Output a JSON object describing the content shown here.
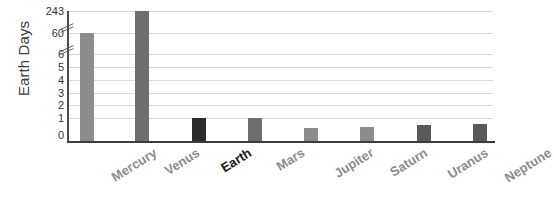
{
  "chart_data": {
    "type": "bar",
    "title": "",
    "xlabel": "",
    "ylabel": "Earth Days",
    "categories": [
      "Mercury",
      "Venus",
      "Earth",
      "Mars",
      "Jupiter",
      "Saturn",
      "Uranus",
      "Neptune"
    ],
    "values": [
      59,
      243,
      1,
      1.7,
      0.4,
      0.45,
      0.7,
      0.9
    ],
    "value_labels": [
      "59",
      "243",
      "1",
      "1.7",
      "0.4",
      "0.45",
      "0.7",
      "0.9"
    ],
    "ylim": [
      0,
      243
    ],
    "y_ticks": [
      "0",
      "1",
      "2",
      "3",
      "4",
      "5",
      "6",
      "60",
      "243"
    ],
    "y_axis_broken": true,
    "y_break_points": [
      "6",
      "60"
    ],
    "grid": true,
    "legend": "none",
    "bar_colors": [
      "#8c8c8c",
      "#6e6e6e",
      "#2b2b2b",
      "#6e6e6e",
      "#8c8c8c",
      "#8c8c8c",
      "#5a5a5a",
      "#5a5a5a"
    ],
    "emphasized_category": "Earth"
  },
  "axis": {
    "y_title": "Earth Days",
    "ticks": [
      {
        "label": "243",
        "y": 11
      },
      {
        "label": "60",
        "y": 33
      },
      {
        "label": "6",
        "y": 54
      },
      {
        "label": "5",
        "y": 67
      },
      {
        "label": "4",
        "y": 80
      },
      {
        "label": "3",
        "y": 93
      },
      {
        "label": "2",
        "y": 105
      },
      {
        "label": "1",
        "y": 118
      },
      {
        "label": "0",
        "y": 135
      }
    ]
  },
  "bars": [
    {
      "name": "Mercury",
      "value": 59,
      "x": 80,
      "top": 33,
      "color": "#8c8c8c",
      "emph": false
    },
    {
      "name": "Venus",
      "value": 243,
      "x": 135,
      "top": 11,
      "color": "#6e6e6e",
      "emph": false
    },
    {
      "name": "Earth",
      "value": 1,
      "x": 192,
      "top": 118,
      "color": "#2b2b2b",
      "emph": true
    },
    {
      "name": "Mars",
      "value": 1.7,
      "x": 248,
      "top": 118,
      "color": "#6e6e6e",
      "emph": false
    },
    {
      "name": "Jupiter",
      "value": 0.4,
      "x": 304,
      "top": 128,
      "color": "#8c8c8c",
      "emph": false
    },
    {
      "name": "Saturn",
      "value": 0.45,
      "x": 360,
      "top": 127,
      "color": "#8c8c8c",
      "emph": false
    },
    {
      "name": "Uranus",
      "value": 0.7,
      "x": 417,
      "top": 125,
      "color": "#5a5a5a",
      "emph": false
    },
    {
      "name": "Neptune",
      "value": 0.9,
      "x": 473,
      "top": 124,
      "color": "#5a5a5a",
      "emph": false
    }
  ],
  "gridlines": [
    11,
    33,
    54,
    67,
    80,
    93,
    105,
    118
  ],
  "breaks": [
    22,
    44
  ]
}
